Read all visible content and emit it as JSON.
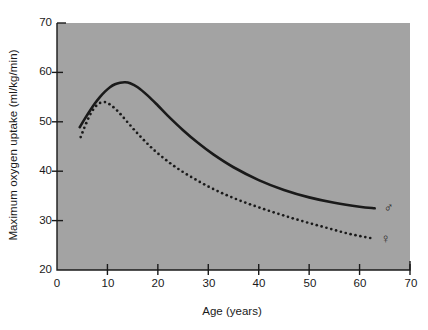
{
  "chart_data": {
    "type": "line",
    "title": "",
    "xlabel": "Age (years)",
    "ylabel": "Maximum oxygen uptake (ml/kg/min)",
    "xlim": [
      0,
      70
    ],
    "ylim": [
      20,
      70
    ],
    "xticks": [
      0,
      10,
      20,
      30,
      40,
      50,
      60,
      70
    ],
    "yticks": [
      20,
      30,
      40,
      50,
      60,
      70
    ],
    "grid": false,
    "legend_position": "inline-end-of-line",
    "plot_background": "#a3a3a3",
    "line_color": "#1a1a1a",
    "series": [
      {
        "name": "male",
        "symbol": "♂",
        "style": "solid",
        "x": [
          4.5,
          5.5,
          6.5,
          7.5,
          8.5,
          9.5,
          10.5,
          11.5,
          12.5,
          13.5,
          14.5,
          16,
          18,
          20,
          22,
          25,
          28,
          31,
          35,
          40,
          45,
          50,
          55,
          60,
          63
        ],
        "y": [
          48.9,
          50.6,
          52.2,
          53.7,
          55.0,
          56.1,
          57.0,
          57.6,
          57.9,
          58.0,
          57.8,
          57.0,
          55.3,
          53.3,
          51.2,
          48.3,
          45.7,
          43.4,
          40.8,
          38.2,
          36.2,
          34.7,
          33.6,
          32.8,
          32.5
        ]
      },
      {
        "name": "female",
        "symbol": "♀",
        "style": "dotted",
        "x": [
          4.7,
          5.5,
          6.5,
          7.5,
          8.5,
          9.5,
          10.5,
          12,
          14,
          16,
          18,
          20,
          23,
          26,
          30,
          34,
          38,
          42,
          46,
          50,
          54,
          58,
          62.5
        ],
        "y": [
          46.9,
          49.0,
          51.3,
          52.9,
          53.8,
          54.0,
          53.5,
          52.2,
          49.9,
          47.6,
          45.5,
          43.6,
          41.2,
          39.2,
          36.9,
          35.0,
          33.4,
          32.0,
          30.7,
          29.5,
          28.4,
          27.3,
          26.4
        ]
      }
    ],
    "annotations": [
      {
        "label": "♂",
        "x": 64.8,
        "y": 32.5,
        "series": "male"
      },
      {
        "label": "♀",
        "x": 64.2,
        "y": 26.2,
        "series": "female"
      }
    ]
  },
  "axis": {
    "y_tick_labels": [
      "70",
      "60",
      "50",
      "40",
      "30",
      "20"
    ],
    "x_tick_labels": [
      "0",
      "10",
      "20",
      "30",
      "40",
      "50",
      "60",
      "70"
    ]
  }
}
